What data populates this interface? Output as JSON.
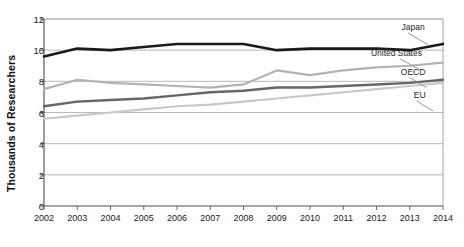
{
  "chart_data": {
    "type": "line",
    "title": "",
    "xlabel": "",
    "ylabel": "Thousands of Researchers",
    "categories": [
      "2002",
      "2003",
      "2004",
      "2005",
      "2006",
      "2007",
      "2008",
      "2009",
      "2010",
      "2011",
      "2012",
      "2013",
      "2014"
    ],
    "x": [
      2002,
      2003,
      2004,
      2005,
      2006,
      2007,
      2008,
      2009,
      2010,
      2011,
      2012,
      2013,
      2014
    ],
    "ylim": [
      0,
      12
    ],
    "yticks": [
      0,
      2,
      4,
      6,
      8,
      10,
      12
    ],
    "ytick_labels": [
      "0",
      "2",
      "4",
      "6",
      "8",
      "10",
      "12"
    ],
    "grid": true,
    "grid_axis": "y",
    "legend": "inline-labels-right",
    "series": [
      {
        "name": "Japan",
        "color": "#1a1a1a",
        "width": 2.6,
        "values": [
          9.6,
          10.1,
          10.0,
          10.2,
          10.4,
          10.4,
          10.4,
          10.0,
          10.1,
          10.1,
          10.1,
          10.0,
          10.4
        ],
        "label_x": 2013.1,
        "label_y": 11.5
      },
      {
        "name": "United States",
        "color": "#b3b3b3",
        "width": 2.2,
        "values": [
          7.5,
          8.1,
          7.9,
          7.8,
          7.7,
          7.6,
          7.8,
          8.7,
          8.4,
          8.7,
          8.9,
          9.0,
          9.2
        ],
        "label_x": 2012.6,
        "label_y": 9.8
      },
      {
        "name": "OECD",
        "color": "#666666",
        "width": 2.4,
        "values": [
          6.4,
          6.7,
          6.8,
          6.9,
          7.1,
          7.3,
          7.4,
          7.6,
          7.6,
          7.7,
          7.8,
          7.9,
          8.1
        ],
        "label_x": 2013.1,
        "label_y": 8.6
      },
      {
        "name": "EU",
        "color": "#c8c8c8",
        "width": 2.2,
        "values": [
          5.6,
          5.8,
          6.0,
          6.2,
          6.4,
          6.5,
          6.7,
          6.9,
          7.1,
          7.3,
          7.5,
          7.7,
          7.9
        ],
        "label_x": 2013.3,
        "label_y": 7.1
      }
    ],
    "leaders": [
      {
        "name": "Japan",
        "x1": 2012.95,
        "y1": 11.1,
        "x2": 2013.55,
        "y2": 10.35
      },
      {
        "name": "United States",
        "x1": 2012.7,
        "y1": 9.45,
        "x2": 2013.3,
        "y2": 8.75
      },
      {
        "name": "OECD",
        "x1": 2013.0,
        "y1": 8.25,
        "x2": 2013.5,
        "y2": 7.6
      },
      {
        "name": "EU",
        "x1": 2013.2,
        "y1": 6.75,
        "x2": 2013.7,
        "y2": 6.1
      }
    ]
  },
  "axis": {
    "y_title": "Thousands of Researchers"
  }
}
